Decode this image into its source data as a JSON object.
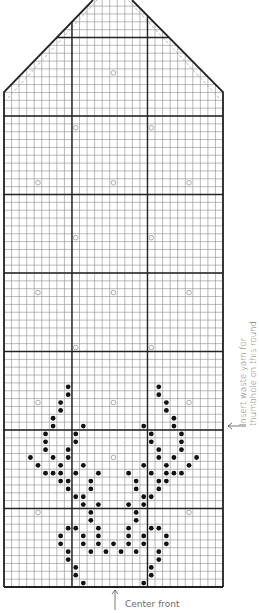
{
  "chart": {
    "columns": 29,
    "rows_straight": 60,
    "grid": {
      "left": 4,
      "right": 223,
      "bottom": 587,
      "shoulder_y": 92,
      "cell_w": 7.55,
      "cell_h": 7.85,
      "thick_every_rows": 10,
      "thick_cols": [
        9,
        19
      ],
      "apex_left_x": 93,
      "apex_right_x": 132
    },
    "colors": {
      "thin_line": "#8c8c8c",
      "thick_line": "#222222",
      "dot": "#111111",
      "circle": "#9a9a9a",
      "dashed": "#b8b8b8",
      "text": "#6a6a6a"
    },
    "legend_symbols": {
      "dot": "filled-dot (contrast color stitch)",
      "circle": "open-circle (accent stitch)"
    },
    "dots_left_half": [
      [
        0,
        [
          10
        ]
      ],
      [
        1,
        [
          9
        ]
      ],
      [
        2,
        [
          9
        ]
      ],
      [
        3,
        [
          8
        ]
      ],
      [
        4,
        [
          8,
          11,
          13
        ]
      ],
      [
        5,
        [
          7,
          10,
          12,
          14
        ]
      ],
      [
        6,
        [
          7,
          10,
          12
        ]
      ],
      [
        7,
        [
          8,
          9,
          12
        ]
      ],
      [
        8,
        [
          11
        ]
      ],
      [
        9,
        [
          11
        ]
      ],
      [
        10,
        [
          10,
          12
        ]
      ],
      [
        11,
        [
          9,
          10
        ]
      ],
      [
        12,
        [
          8,
          11
        ]
      ],
      [
        13,
        [
          7,
          8,
          11
        ]
      ],
      [
        14,
        [
          5,
          6,
          7,
          9,
          12
        ]
      ],
      [
        15,
        [
          4,
          7,
          10
        ]
      ],
      [
        16,
        [
          3,
          6,
          8
        ]
      ],
      [
        17,
        [
          5,
          8
        ]
      ],
      [
        18,
        [
          5,
          9
        ]
      ],
      [
        19,
        [
          5,
          9
        ]
      ],
      [
        20,
        [
          6,
          10
        ]
      ],
      [
        21,
        [
          6
        ]
      ],
      [
        22,
        [
          7
        ]
      ],
      [
        23,
        [
          7
        ]
      ],
      [
        24,
        [
          8
        ]
      ],
      [
        25,
        [
          8
        ]
      ]
    ],
    "circles": [
      [
        9,
        [
          4,
          24
        ]
      ],
      [
        16,
        [
          14
        ]
      ],
      [
        23,
        [
          4,
          14,
          24
        ]
      ],
      [
        30,
        [
          9,
          19
        ]
      ],
      [
        37,
        [
          4,
          14,
          24
        ]
      ],
      [
        44,
        [
          9,
          19
        ]
      ],
      [
        51,
        [
          4,
          14,
          24
        ]
      ],
      [
        58,
        [
          9,
          19
        ]
      ],
      [
        65,
        [
          14
        ]
      ]
    ]
  },
  "annotations": {
    "thumbhole_line1": "Insert waste yarn for",
    "thumbhole_line2": "thumbhole on this round",
    "thumbhole_arrow_y": 426,
    "center_front": "Center front",
    "center_front_arrow_x": 115
  }
}
